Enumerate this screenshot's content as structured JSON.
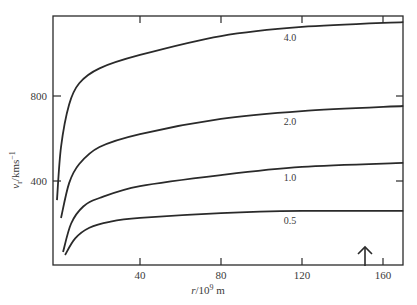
{
  "chart_data": {
    "type": "line",
    "title": "",
    "xlabel": "r/10^9 m",
    "ylabel": "v_r/kms^-1",
    "xlim": [
      0,
      170
    ],
    "ylim": [
      0,
      1170
    ],
    "grid": false,
    "legend_position": "inline curve labels",
    "x_ticks": [
      40,
      80,
      120,
      160
    ],
    "y_ticks": [
      400,
      800
    ],
    "x_tick_labels": [
      "40",
      "80",
      "120",
      "160"
    ],
    "y_tick_labels": [
      "400",
      "800"
    ],
    "annotations": [
      {
        "type": "arrow-up",
        "x": 151,
        "label": ""
      }
    ],
    "series": [
      {
        "name": "4.0",
        "x": [
          -1,
          1,
          5,
          10,
          20,
          40,
          80,
          120,
          170
        ],
        "values": [
          310,
          560,
          760,
          860,
          930,
          993,
          1082,
          1125,
          1148
        ]
      },
      {
        "name": "2.0",
        "x": [
          1,
          5,
          10,
          20,
          40,
          80,
          120,
          170
        ],
        "values": [
          226,
          390,
          480,
          560,
          621,
          692,
          729,
          753
        ]
      },
      {
        "name": "1.0",
        "x": [
          2,
          6,
          12,
          20,
          40,
          80,
          120,
          170
        ],
        "values": [
          66,
          200,
          280,
          320,
          376,
          428,
          466,
          485
        ]
      },
      {
        "name": "0.5",
        "x": [
          3,
          8,
          15,
          25,
          40,
          80,
          120,
          170
        ],
        "values": [
          52,
          130,
          180,
          208,
          226,
          249,
          259,
          259
        ]
      }
    ]
  },
  "labels": {
    "xlabel_r": "r",
    "xlabel_rest": "/10",
    "xlabel_exp": "9",
    "xlabel_unit": " m",
    "ylabel_v": "v",
    "ylabel_sub": "r",
    "ylabel_rest": "/kms",
    "ylabel_exp": "−1"
  }
}
